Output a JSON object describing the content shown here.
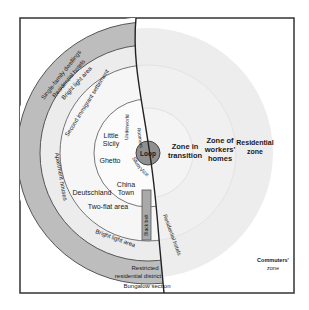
{
  "diagram": {
    "type": "concentric-zone-model",
    "colors": {
      "background": "#ffffff",
      "frame": "#333333",
      "outer_gray_ring": "#b9b9b9",
      "left_light": "#ececec",
      "loop": "#8f8f8f",
      "right_light": "#ededed",
      "black_belt": "#a9a9a9"
    },
    "center": {
      "label": "Loop"
    },
    "right_zones": {
      "transition": "Zone in transition",
      "transition_line1": "Zone in",
      "transition_line2": "transition",
      "workers_line1": "Zone of",
      "workers_line2": "workers'",
      "workers_line3": "homes",
      "residential_line1": "Residential",
      "residential_line2": "zone",
      "commuters_line1": "Commuters'",
      "commuters_line2": "zone"
    },
    "left_labels": {
      "single_family": "Single-family dwellings",
      "residential_hotels_top": "Residential hotels",
      "bright_light_top": "Bright light area",
      "second_immigrant": "Second immigrant settlement",
      "underworld": "Underworld",
      "roomers": "Roomers",
      "little_sicily_1": "Little",
      "little_sicily_2": "Sicily",
      "ghetto": "Ghetto",
      "slum": "Slum",
      "vice": "Vice",
      "china_town_1": "China",
      "china_town_2": "Town",
      "deutschland": "Deutschland",
      "two_flat": "Two-flat area",
      "black_belt": "Black belt",
      "apartment_houses": "Apartment houses",
      "bright_light_bottom": "Bright light area",
      "residential_hotels_right": "Residential hotels",
      "restricted_1": "Restricted",
      "restricted_2": "residential district",
      "bungalow": "Bungalow section"
    }
  }
}
